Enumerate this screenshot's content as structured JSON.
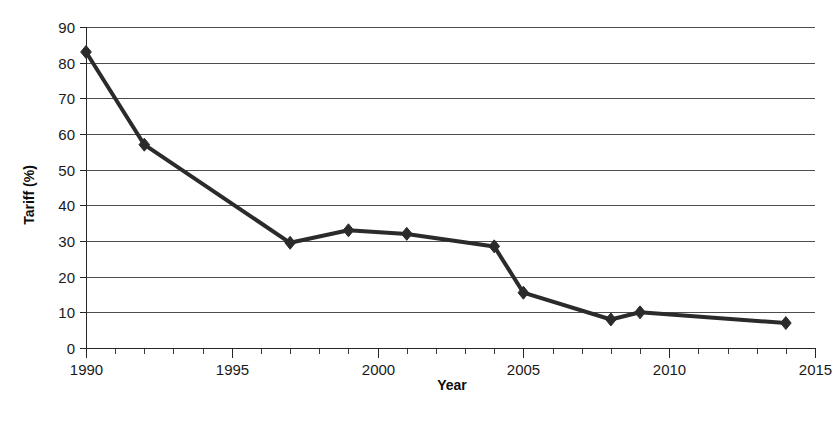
{
  "chart_data": {
    "type": "line",
    "title": "",
    "xlabel": "Year",
    "ylabel": "Tariff (%)",
    "xlim": [
      1990,
      2015
    ],
    "ylim": [
      0,
      90
    ],
    "xticks": [
      1990,
      1995,
      2000,
      2005,
      2010,
      2015
    ],
    "xtick_labels": [
      "1990",
      "1995",
      "2000",
      "2005",
      "2010",
      "2015"
    ],
    "xtick_minor_step": 1,
    "yticks": [
      0,
      10,
      20,
      30,
      40,
      50,
      60,
      70,
      80,
      90
    ],
    "ytick_labels": [
      "0",
      "10",
      "20",
      "30",
      "40",
      "50",
      "60",
      "70",
      "80",
      "90"
    ],
    "grid": "horizontal",
    "legend": "none",
    "marker": "diamond",
    "line_color": "#2b2b2b",
    "x": [
      1990,
      1992,
      1997,
      1999,
      2001,
      2004,
      2005,
      2008,
      2009,
      2014
    ],
    "values": [
      83,
      57,
      29.5,
      33,
      32,
      28.5,
      15.5,
      8,
      10,
      7
    ],
    "series": [
      {
        "name": "Tariff",
        "points": [
          {
            "x": 1990,
            "y": 83
          },
          {
            "x": 1992,
            "y": 57
          },
          {
            "x": 1997,
            "y": 29.5
          },
          {
            "x": 1999,
            "y": 33
          },
          {
            "x": 2001,
            "y": 32
          },
          {
            "x": 2004,
            "y": 28.5
          },
          {
            "x": 2005,
            "y": 15.5
          },
          {
            "x": 2008,
            "y": 8
          },
          {
            "x": 2009,
            "y": 10
          },
          {
            "x": 2014,
            "y": 7
          }
        ]
      }
    ]
  },
  "plot_geometry": {
    "left": 86,
    "right": 815,
    "top": 27,
    "bottom": 348
  }
}
